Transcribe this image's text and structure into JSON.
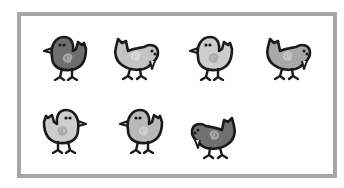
{
  "scene": {
    "description": "Seven cartoon chicks inside a gray frame",
    "frame_color": "#a6a6a6",
    "outline_color": "#1a1a1a",
    "chick_count": 7,
    "chicks": [
      {
        "id": 1,
        "row": 1,
        "pose": "standing",
        "facing": "left",
        "fill": "#6e6e6e",
        "swirl": "#a8a8a8",
        "x": 38,
        "y": 27
      },
      {
        "id": 2,
        "row": 1,
        "pose": "pecking",
        "facing": "right",
        "fill": "#c4c4c4",
        "swirl": "#dadada",
        "x": 108,
        "y": 27
      },
      {
        "id": 3,
        "row": 1,
        "pose": "standing",
        "facing": "left",
        "fill": "#cdcdcd",
        "swirl": "#a9a9a9",
        "x": 184,
        "y": 27
      },
      {
        "id": 4,
        "row": 1,
        "pose": "pecking",
        "facing": "right",
        "fill": "#a8a8a8",
        "swirl": "#c6c6c6",
        "x": 260,
        "y": 27
      },
      {
        "id": 5,
        "row": 2,
        "pose": "standing",
        "facing": "right",
        "fill": "#cdcdcd",
        "swirl": "#a9a9a9",
        "x": 38,
        "y": 100
      },
      {
        "id": 6,
        "row": 2,
        "pose": "standing",
        "facing": "left",
        "fill": "#b9b9b9",
        "swirl": "#cfcfcf",
        "x": 114,
        "y": 100
      },
      {
        "id": 7,
        "row": 2,
        "pose": "pecking",
        "facing": "left",
        "fill": "#707070",
        "swirl": "#a8a8a8",
        "x": 188,
        "y": 106
      }
    ]
  }
}
